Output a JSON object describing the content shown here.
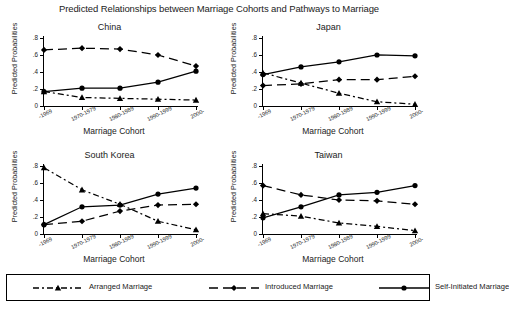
{
  "chart_data": {
    "type": "line",
    "title": "Predicted Relationships between Marriage Cohorts and Pathways to Marriage",
    "xlabel": "Marriage Cohort",
    "ylabel": "Predicted Probabilities",
    "categories": [
      "-1969",
      "1970-1979",
      "1980-1989",
      "1990-1999",
      "2000-"
    ],
    "ylim": [
      0,
      0.8
    ],
    "yticks": [
      0,
      0.2,
      0.4,
      0.6,
      0.8
    ],
    "ytick_labels": [
      "0",
      ".2",
      ".4",
      ".6",
      ".8"
    ],
    "grid": false,
    "legend_position": "bottom",
    "panels": [
      {
        "title": "China",
        "series": [
          {
            "name": "Arranged Marriage",
            "values": [
              0.17,
              0.1,
              0.09,
              0.08,
              0.07
            ]
          },
          {
            "name": "Introduced Marriage",
            "values": [
              0.66,
              0.68,
              0.67,
              0.6,
              0.47
            ]
          },
          {
            "name": "Self-Initiated Marriage",
            "values": [
              0.17,
              0.21,
              0.21,
              0.28,
              0.41
            ]
          }
        ]
      },
      {
        "title": "Japan",
        "series": [
          {
            "name": "Arranged Marriage",
            "values": [
              0.39,
              0.27,
              0.15,
              0.05,
              0.02
            ]
          },
          {
            "name": "Introduced Marriage",
            "values": [
              0.24,
              0.26,
              0.31,
              0.31,
              0.35
            ]
          },
          {
            "name": "Self-Initiated Marriage",
            "values": [
              0.37,
              0.46,
              0.52,
              0.6,
              0.59
            ]
          }
        ]
      },
      {
        "title": "South Korea",
        "series": [
          {
            "name": "Arranged Marriage",
            "values": [
              0.78,
              0.52,
              0.35,
              0.15,
              0.05
            ]
          },
          {
            "name": "Introduced Marriage",
            "values": [
              0.11,
              0.15,
              0.27,
              0.34,
              0.35
            ]
          },
          {
            "name": "Self-Initiated Marriage",
            "values": [
              0.11,
              0.32,
              0.34,
              0.47,
              0.54
            ]
          }
        ]
      },
      {
        "title": "Taiwan",
        "series": [
          {
            "name": "Arranged Marriage",
            "values": [
              0.24,
              0.21,
              0.13,
              0.09,
              0.04
            ]
          },
          {
            "name": "Introduced Marriage",
            "values": [
              0.57,
              0.46,
              0.4,
              0.39,
              0.35
            ]
          },
          {
            "name": "Self-Initiated Marriage",
            "values": [
              0.19,
              0.32,
              0.46,
              0.49,
              0.57
            ]
          }
        ]
      }
    ],
    "legend": [
      {
        "label": "Arranged Marriage",
        "marker": "triangle",
        "dash": "6,3,2,3",
        "color": "#000000"
      },
      {
        "label": "Introduced Marriage",
        "marker": "diamond",
        "dash": "9,5",
        "color": "#000000"
      },
      {
        "label": "Self-Initiated Marriage",
        "marker": "circle",
        "dash": "none",
        "color": "#000000"
      }
    ]
  }
}
